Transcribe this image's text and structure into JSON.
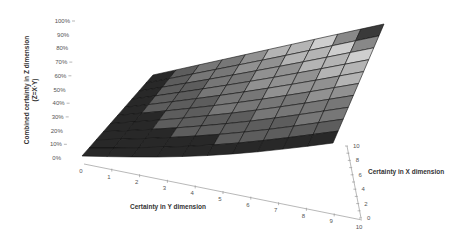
{
  "chart_data": {
    "type": "surface3d",
    "title": "",
    "function": "Z = X * Y",
    "zlabel_line1": "Combined certainty in Z dimension",
    "zlabel_line2": "(Z=X·Y)",
    "ylabel": "Certainty in Y dimension",
    "xlabel": "Certainty in X dimension",
    "z_ticks": [
      "0%",
      "10%",
      "20%",
      "30%",
      "40%",
      "50%",
      "60%",
      "70%",
      "80%",
      "90%",
      "100%"
    ],
    "y_ticks": [
      "0",
      "1",
      "2",
      "3",
      "4",
      "5",
      "6",
      "7",
      "8",
      "9",
      "10"
    ],
    "x_ticks": [
      "0",
      "2",
      "4",
      "6",
      "8",
      "10"
    ],
    "x_range": [
      0,
      10
    ],
    "y_range": [
      0,
      10
    ],
    "z_range": [
      0,
      1
    ],
    "grid_steps": 10,
    "grid": true,
    "legend": false,
    "colors": {
      "shade_dark": "#2a2a2a",
      "shade_light": "#d8d8d8",
      "mesh_line": "#111111",
      "axis_line": "#999999"
    }
  }
}
